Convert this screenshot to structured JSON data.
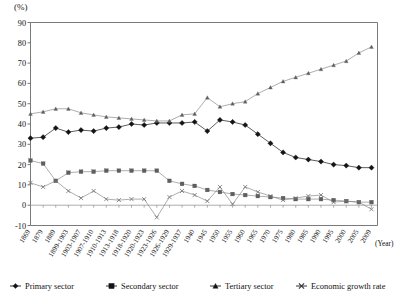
{
  "axes": {
    "y_unit_label": "(%)",
    "y_ticks": [
      "90",
      "80",
      "70",
      "60",
      "50",
      "40",
      "30",
      "20",
      "10",
      "0",
      "-10"
    ],
    "x_axis_caption": "(Year)"
  },
  "legend": {
    "items": [
      {
        "label": "Primary sector",
        "marker": "diamond-marker"
      },
      {
        "label": "Secondary sector",
        "marker": "square-marker"
      },
      {
        "label": "Tertiary sector",
        "marker": "triangle-marker"
      },
      {
        "label": "Economic growth rate",
        "marker": "x-marker"
      }
    ]
  },
  "chart_data": {
    "type": "line",
    "title": "",
    "xlabel": "(Year)",
    "ylabel": "(%)",
    "ylim": [
      -10,
      90
    ],
    "grid": false,
    "legend_position": "bottom",
    "categories": [
      "1869",
      "1879",
      "1889",
      "1899-1903",
      "1903-1907",
      "1907-1910",
      "1910-1913",
      "1913-1918",
      "1918-1920",
      "1920-1923",
      "1923-1926",
      "1926-1929",
      "1929-1937",
      "1940",
      "1945",
      "1950",
      "1955",
      "1960",
      "1965",
      "1970",
      "1975",
      "1980",
      "1985",
      "1990",
      "1995",
      "2000",
      "2005",
      "2009"
    ],
    "series": [
      {
        "name": "Primary sector",
        "marker": "diamond",
        "values": [
          33,
          33.5,
          38,
          36,
          37,
          36.5,
          38,
          38.5,
          40,
          39.5,
          40.5,
          40.5,
          40.5,
          41,
          36.5,
          42,
          41,
          39.5,
          35,
          30.5,
          26,
          23.5,
          22.5,
          21.5,
          20,
          19.5,
          18.5,
          18.5
        ]
      },
      {
        "name": "Secondary sector",
        "marker": "square",
        "values": [
          22,
          20.5,
          12,
          16,
          16.5,
          16.5,
          17,
          17,
          17,
          17,
          17,
          12,
          10.5,
          9.5,
          7.5,
          6.5,
          5.5,
          5,
          4.5,
          4,
          3.5,
          3,
          3,
          3,
          2.5,
          2,
          1.5,
          1.5
        ]
      },
      {
        "name": "Tertiary sector",
        "marker": "triangle",
        "values": [
          45,
          46,
          47.5,
          47.5,
          45.5,
          44.5,
          43.5,
          43,
          42.5,
          42,
          41.5,
          41.5,
          44.5,
          45,
          53,
          48.5,
          50,
          51,
          55,
          58,
          61,
          63,
          65,
          67,
          69,
          71,
          75,
          78
        ]
      },
      {
        "name": "Economic growth rate",
        "marker": "x",
        "values": [
          11,
          9,
          12,
          7,
          3.5,
          7,
          3,
          2.5,
          3,
          3,
          -6,
          4,
          7,
          5,
          2,
          9,
          0.5,
          9,
          6.5,
          4.5,
          2.5,
          3.5,
          4.5,
          5,
          1.5,
          2,
          1.5,
          -2
        ]
      }
    ]
  }
}
